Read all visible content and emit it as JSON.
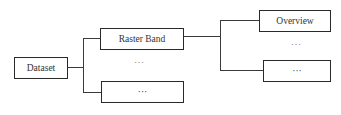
{
  "diagram": {
    "type": "tree",
    "nodes": {
      "dataset": {
        "label": "Dataset"
      },
      "raster_band": {
        "label": "Raster Band"
      },
      "band_more": {
        "label": "···"
      },
      "overview": {
        "label": "Overview"
      },
      "overview_more": {
        "label": "···"
      }
    },
    "ellipses": {
      "bands_between": "···",
      "overviews_between": "···"
    },
    "edges": [
      {
        "from": "Dataset",
        "to": "Raster Band"
      },
      {
        "from": "Dataset",
        "to": "···"
      },
      {
        "from": "Raster Band",
        "to": "Overview"
      },
      {
        "from": "Raster Band",
        "to": "···"
      }
    ],
    "colors": {
      "stroke": "#2a2a2a",
      "text": "#333333",
      "background": "#ffffff"
    }
  }
}
